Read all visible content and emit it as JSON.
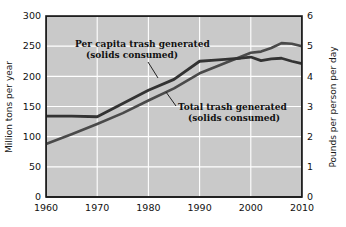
{
  "chart_data": {
    "type": "line",
    "title": "",
    "xlabel": "",
    "ylabel": "Million tons per year",
    "y2label": "Pounds per person per day",
    "xlim": [
      1960,
      2010
    ],
    "ylim": [
      0,
      300
    ],
    "y2lim": [
      0,
      6
    ],
    "grid": true,
    "legend": "annotations-inline",
    "background": "#c9c9c9",
    "gridline_color": "#ffffff",
    "line_color": "#3a3a3a",
    "xticks": [
      "1960",
      "1970",
      "1980",
      "1990",
      "2000",
      "2010"
    ],
    "xtick_values": [
      1960,
      1970,
      1980,
      1990,
      2000,
      2010
    ],
    "yticks": [
      "0",
      "50",
      "100",
      "150",
      "200",
      "250",
      "300"
    ],
    "ytick_values": [
      0,
      50,
      100,
      150,
      200,
      250,
      300
    ],
    "y2ticks": [
      "0",
      "1",
      "2",
      "3",
      "4",
      "5",
      "6"
    ],
    "y2tick_values": [
      0,
      1,
      2,
      3,
      4,
      5,
      6
    ],
    "series": [
      {
        "name": "Per capita trash generated (solids consumed)",
        "axis": "right",
        "unit": "pounds per person per day",
        "x": [
          1960,
          1965,
          1970,
          1975,
          1980,
          1985,
          1990,
          1993,
          1995,
          1998,
          2000,
          2002,
          2004,
          2006,
          2008,
          2010
        ],
        "values": [
          2.68,
          2.68,
          2.66,
          3.1,
          3.54,
          3.9,
          4.5,
          4.54,
          4.56,
          4.6,
          4.64,
          4.52,
          4.58,
          4.6,
          4.5,
          4.42
        ],
        "values_left_scale": [
          134,
          134,
          133,
          155,
          177,
          195,
          225,
          227,
          228,
          230,
          232,
          226,
          229,
          230,
          225,
          221
        ]
      },
      {
        "name": "Total trash generated (solids consumed)",
        "axis": "left",
        "unit": "million tons per year",
        "x": [
          1960,
          1965,
          1970,
          1975,
          1980,
          1985,
          1990,
          1995,
          2000,
          2002,
          2004,
          2006,
          2008,
          2010
        ],
        "values": [
          88,
          104,
          121,
          139,
          160,
          180,
          205,
          222,
          239,
          241,
          247,
          255,
          254,
          250
        ]
      }
    ],
    "annotations": [
      {
        "id": "per-capita-annotation",
        "line1": "Per capita trash generated",
        "line2": "(solids consumed)",
        "points_to_series": "Per capita trash generated (solids consumed)"
      },
      {
        "id": "total-trash-annotation",
        "line1": "Total trash generated",
        "line2": "(solids consumed)",
        "points_to_series": "Total trash generated (solids consumed)"
      }
    ]
  }
}
